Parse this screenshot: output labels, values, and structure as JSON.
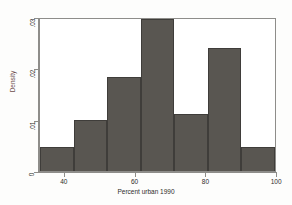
{
  "chart_data": {
    "type": "bar",
    "title": "",
    "subtitle": "",
    "xlabel": "Percent urban 1990",
    "ylabel": "Density",
    "xlim": [
      33,
      100
    ],
    "ylim": [
      0,
      0.03
    ],
    "grid": false,
    "legend": null,
    "bin_width": 9.571,
    "xticks": [
      "40",
      "60",
      "80",
      "100"
    ],
    "xtick_values": [
      40,
      60,
      80,
      100
    ],
    "yticks": [
      "0",
      ".01",
      ".02",
      ".03"
    ],
    "ytick_values": [
      0,
      0.01,
      0.02,
      0.03
    ],
    "bin_edges": [
      33,
      42.57,
      52.14,
      61.71,
      71.29,
      80.86,
      90.43,
      100
    ],
    "categories": [
      "33-42.6",
      "42.6-52.1",
      "52.1-61.7",
      "61.7-71.3",
      "71.3-80.9",
      "80.9-90.4",
      "90.4-100"
    ],
    "values": [
      0.0047,
      0.0101,
      0.0185,
      0.03,
      0.0113,
      0.0243,
      0.0047
    ],
    "bar_color": "#595651",
    "bar_edge_color": "#3f3d3a",
    "axis_color": "#8e8d8a",
    "background_color": "#ffffff"
  }
}
